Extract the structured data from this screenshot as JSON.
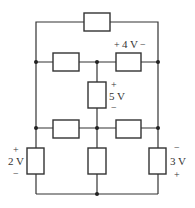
{
  "diagram": {
    "type": "resistive-circuit",
    "labels": {
      "r_mid_right": {
        "plus": "+",
        "value": "4 V",
        "minus": "−"
      },
      "r_center_vertical": {
        "plus": "+",
        "value": "5 V",
        "minus": "−"
      },
      "r_left_bottom": {
        "plus": "+",
        "value": "2 V",
        "minus": "−"
      },
      "r_right_bottom": {
        "minus": "−",
        "value": "3 V",
        "plus": "+"
      }
    },
    "components": [
      {
        "id": "r_top",
        "label": ""
      },
      {
        "id": "r_mid_left",
        "label": ""
      },
      {
        "id": "r_mid_right",
        "label": "4 V"
      },
      {
        "id": "r_center_vertical",
        "label": "5 V"
      },
      {
        "id": "r_low_left",
        "label": ""
      },
      {
        "id": "r_low_right",
        "label": ""
      },
      {
        "id": "r_left_bottom",
        "label": "2 V"
      },
      {
        "id": "r_center_bottom",
        "label": ""
      },
      {
        "id": "r_right_bottom",
        "label": "3 V"
      }
    ],
    "colors": {
      "line": "#333333",
      "background": "#ffffff"
    }
  }
}
